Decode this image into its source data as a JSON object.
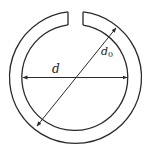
{
  "diagram": {
    "type": "split-ring-dimension-drawing",
    "labels": {
      "inner_diameter": "d",
      "outer_diameter_base": "d",
      "outer_diameter_sub": "0"
    },
    "colors": {
      "line": "#2a2a2a",
      "background": "#ffffff"
    }
  }
}
